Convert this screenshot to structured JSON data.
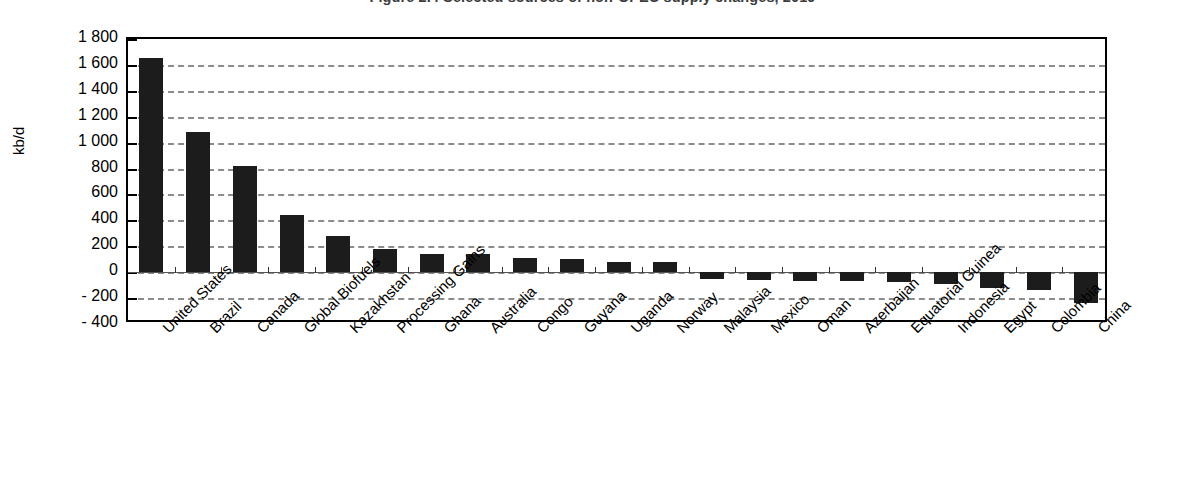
{
  "chart_data": {
    "type": "bar",
    "title": "Figure 2.4 Selected sources of non-OPEC supply changes, 2019",
    "xlabel": "",
    "ylabel": "kb/d",
    "ylim": [
      -400,
      1800
    ],
    "yticks": [
      1800,
      1600,
      1400,
      1200,
      1000,
      800,
      600,
      400,
      200,
      0,
      -200,
      -400
    ],
    "ytick_labels": [
      "1 800",
      "1 600",
      "1 400",
      "1 200",
      "1 000",
      "800",
      "600",
      "400",
      "200",
      "0",
      "- 200",
      "- 400"
    ],
    "grid": true,
    "grid_style": "dashed",
    "legend": null,
    "bar_color": "#1c1c1c",
    "categories": [
      "United States",
      "Brazil",
      "Canada",
      "Global Biofuels",
      "Kazakhstan",
      "Processing Gains",
      "Ghana",
      "Australia",
      "Congo",
      "Guyana",
      "Uganda",
      "Norway",
      "Malaysia",
      "Mexico",
      "Oman",
      "Azerbaijan",
      "Equatorial Guinea",
      "Indonesia",
      "Egypt",
      "Colombia",
      "China"
    ],
    "values": [
      1650,
      1080,
      820,
      440,
      280,
      180,
      140,
      140,
      110,
      105,
      80,
      75,
      -50,
      -60,
      -65,
      -70,
      -75,
      -90,
      -125,
      -135,
      -235
    ]
  }
}
